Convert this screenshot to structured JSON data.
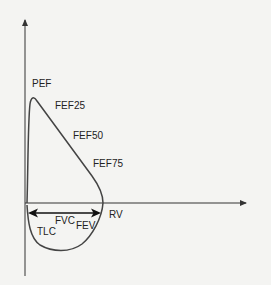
{
  "diagram": {
    "type": "flow-volume-loop",
    "labels": {
      "pef": "PEF",
      "fef25": "FEF25",
      "fef50": "FEF50",
      "fef75": "FEF75",
      "rv": "RV",
      "tlc": "TLC",
      "fvc": "FVC",
      "fev": "FEV"
    },
    "colors": {
      "axis": "#333333",
      "curve": "#444444",
      "text": "#222222",
      "background": "#f4f4f2"
    }
  }
}
